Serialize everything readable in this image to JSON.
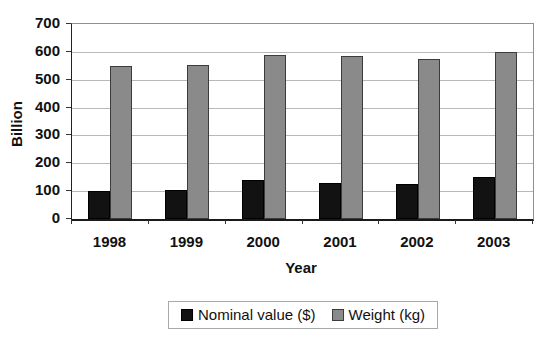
{
  "chart_data": {
    "type": "bar",
    "title": "",
    "categories": [
      "1998",
      "1999",
      "2000",
      "2001",
      "2002",
      "2003"
    ],
    "series": [
      {
        "name": "Nominal value ($)",
        "color": "#121212",
        "border": "#000000",
        "values": [
          100,
          105,
          140,
          130,
          125,
          150
        ]
      },
      {
        "name": "Weight (kg)",
        "color": "#8a8a8a",
        "border": "#3c3c3c",
        "values": [
          548,
          553,
          589,
          584,
          575,
          598
        ]
      }
    ],
    "xlabel": "Year",
    "ylabel": "Billion",
    "ylim": [
      0,
      700
    ],
    "yticks": [
      0,
      100,
      200,
      300,
      400,
      500,
      600,
      700
    ],
    "grid": true,
    "legend_position": "bottom-center"
  },
  "colors": {
    "background": "#ffffff",
    "gridline": "#b8b8b8",
    "axis_line": "#1a1a1a",
    "plot_border": "#8f8f8f",
    "legend_border": "#a8a8a8",
    "text": "#111111"
  }
}
